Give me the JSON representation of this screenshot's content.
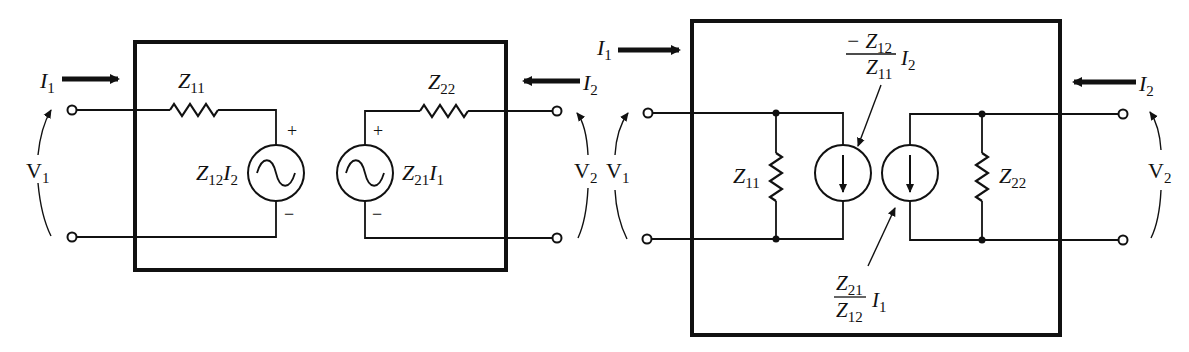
{
  "diagrams": [
    {
      "name": "z-parameter-equivalent",
      "labels": {
        "input_current": "I",
        "input_current_sub": "1",
        "output_current": "I",
        "output_current_sub": "2",
        "input_voltage": "V",
        "input_voltage_sub": "1",
        "output_voltage": "V",
        "output_voltage_sub": "2",
        "series_impedance_1": "Z",
        "series_impedance_1_sub": "11",
        "series_impedance_2": "Z",
        "series_impedance_2_sub": "22",
        "source_1_z": "Z",
        "source_1_z_sub": "12",
        "source_1_i": "I",
        "source_1_i_sub": "2",
        "source_2_z": "Z",
        "source_2_z_sub": "21",
        "source_2_i": "I",
        "source_2_i_sub": "1",
        "plus": "+",
        "minus": "−"
      }
    },
    {
      "name": "norton-equivalent",
      "labels": {
        "input_current": "I",
        "input_current_sub": "1",
        "output_current": "I",
        "output_current_sub": "2",
        "input_voltage": "V",
        "input_voltage_sub": "1",
        "output_voltage": "V",
        "output_voltage_sub": "2",
        "shunt_impedance_1": "Z",
        "shunt_impedance_1_sub": "11",
        "shunt_impedance_2": "Z",
        "shunt_impedance_2_sub": "22",
        "source_1_num_prefix": "− Z",
        "source_1_num_sub": "12",
        "source_1_den": "Z",
        "source_1_den_sub": "11",
        "source_1_i": "I",
        "source_1_i_sub": "2",
        "source_2_num": "Z",
        "source_2_num_sub": "21",
        "source_2_den": "Z",
        "source_2_den_sub": "12",
        "source_2_i": "I",
        "source_2_i_sub": "1"
      }
    }
  ]
}
